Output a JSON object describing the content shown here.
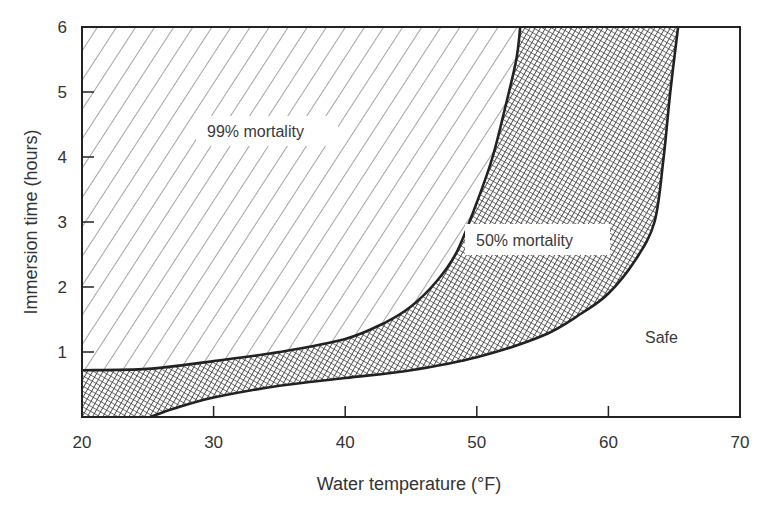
{
  "chart_data": {
    "type": "area",
    "title": "",
    "xlabel": "Water temperature (°F)",
    "ylabel": "Immersion time (hours)",
    "xlim": [
      20,
      70
    ],
    "ylim": [
      0,
      6
    ],
    "x_ticks": [
      20,
      30,
      40,
      50,
      60,
      70
    ],
    "y_ticks": [
      1,
      2,
      3,
      4,
      5,
      6
    ],
    "grid": false,
    "legend": null,
    "series": [
      {
        "name": "99% mortality boundary",
        "x": [
          20,
          25,
          30,
          35,
          40,
          43,
          45,
          47,
          48.5,
          50,
          51.2,
          52.2,
          53,
          53.3
        ],
        "values": [
          0.72,
          0.74,
          0.86,
          1.0,
          1.2,
          1.45,
          1.7,
          2.1,
          2.55,
          3.3,
          4.0,
          4.8,
          5.5,
          6.0
        ]
      },
      {
        "name": "50% mortality boundary",
        "x": [
          25.2,
          27,
          30,
          35,
          40,
          45,
          50,
          55,
          58,
          60,
          62,
          63.5,
          64.2,
          64.7,
          65.3
        ],
        "values": [
          0,
          0.13,
          0.3,
          0.48,
          0.6,
          0.72,
          0.92,
          1.25,
          1.6,
          1.9,
          2.4,
          3.0,
          4.0,
          5.0,
          6.0
        ]
      }
    ],
    "regions": [
      {
        "label": "99% mortality",
        "fill": "diagonal-hatch",
        "description": "above/left of 99% boundary"
      },
      {
        "label": "50% mortality",
        "fill": "cross-hatch",
        "description": "between 99% and 50% boundaries"
      },
      {
        "label": "Safe",
        "fill": "none",
        "description": "below/right of 50% boundary"
      }
    ],
    "annotations": [
      {
        "text": "99% mortality",
        "x": 30.5,
        "y": 4.2
      },
      {
        "text": "50% mortality",
        "x": 55.5,
        "y": 2.7
      },
      {
        "text": "Safe",
        "x": 64.2,
        "y": 1.2
      }
    ]
  },
  "labels": {
    "region_99": "99% mortality",
    "region_50": "50% mortality",
    "region_safe": "Safe",
    "x_axis_title": "Water temperature (°F)",
    "y_axis_title": "Immersion time (hours)"
  },
  "colors": {
    "line": "#222222",
    "hatch": "#555555",
    "crosshatch": "#3a3a3a",
    "text": "#333333",
    "background": "#ffffff"
  }
}
